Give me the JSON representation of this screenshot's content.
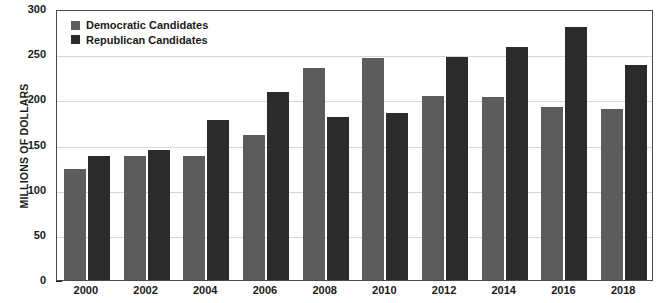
{
  "chart_data": {
    "type": "bar",
    "title": "",
    "xlabel": "",
    "ylabel": "MILLIONS OF DOLLARS",
    "ylim": [
      0,
      300
    ],
    "yticks": [
      0,
      50,
      100,
      150,
      200,
      250,
      300
    ],
    "grid": true,
    "legend_position": "top-left",
    "categories": [
      "2000",
      "2002",
      "2004",
      "2006",
      "2008",
      "2010",
      "2012",
      "2014",
      "2016",
      "2018"
    ],
    "series": [
      {
        "name": "Democratic Candidates",
        "color": "#5c5c5c",
        "values": [
          123,
          137,
          137,
          160,
          235,
          246,
          204,
          203,
          192,
          189
        ]
      },
      {
        "name": "Republican Candidates",
        "color": "#2b2b2b",
        "values": [
          137,
          144,
          177,
          208,
          181,
          185,
          247,
          258,
          280,
          238
        ]
      }
    ]
  },
  "legend": {
    "items": [
      {
        "label": "Democratic Candidates",
        "color": "#5c5c5c"
      },
      {
        "label": "Republican Candidates",
        "color": "#2b2b2b"
      }
    ]
  },
  "axes": {
    "y_title": "MILLIONS OF DOLLARS",
    "y_tick_labels": [
      "300",
      "250",
      "200",
      "150",
      "100",
      "50",
      "0"
    ],
    "x_tick_labels": [
      "2000",
      "2002",
      "2004",
      "2006",
      "2008",
      "2010",
      "2012",
      "2014",
      "2016",
      "2018"
    ]
  }
}
